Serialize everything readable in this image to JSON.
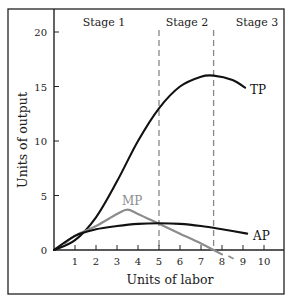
{
  "chart_data": {
    "type": "line",
    "title": "",
    "xlabel": "Units of labor",
    "ylabel": "Units of output",
    "xlim": [
      0,
      11
    ],
    "ylim": [
      0,
      21
    ],
    "x_ticks": [
      1,
      2,
      3,
      4,
      5,
      6,
      7,
      8,
      9,
      10
    ],
    "y_ticks": [
      0,
      5,
      10,
      15,
      20
    ],
    "origin_label": "0",
    "grid": false,
    "legend": "none (curves labeled inline)",
    "stages": [
      {
        "label": "Stage 1",
        "from": 0,
        "to": 5
      },
      {
        "label": "Stage 2",
        "from": 5,
        "to": 7.6
      },
      {
        "label": "Stage 3",
        "from": 7.6,
        "to": 11
      }
    ],
    "dividers": [
      {
        "x": 5,
        "style": "dashed",
        "color": "#888888",
        "meaning": "MP = AP (AP max)"
      },
      {
        "x": 7.6,
        "style": "dashed",
        "color": "#888888",
        "meaning": "MP = 0 (TP max)"
      }
    ],
    "series": [
      {
        "name": "TP",
        "color": "#111111",
        "x": [
          0,
          1,
          2,
          3,
          4,
          5,
          6,
          7,
          7.6,
          8.5,
          9.1
        ],
        "y": [
          0,
          0.9,
          3.0,
          6.3,
          10.0,
          13.0,
          15.0,
          15.9,
          16.0,
          15.6,
          14.9
        ]
      },
      {
        "name": "MP",
        "color": "#8c8c8c",
        "x": [
          0.5,
          1,
          2,
          3,
          3.5,
          4,
          5,
          6,
          7,
          7.6,
          8.0
        ],
        "y": [
          0.6,
          1.3,
          2.2,
          3.3,
          3.7,
          3.3,
          2.4,
          1.5,
          0.6,
          0.0,
          -0.4
        ]
      },
      {
        "name": "AP",
        "color": "#111111",
        "x": [
          0,
          1,
          2,
          3,
          4,
          5,
          6,
          7,
          8,
          9.2
        ],
        "y": [
          0,
          1.3,
          1.9,
          2.2,
          2.4,
          2.45,
          2.4,
          2.2,
          1.9,
          1.5
        ]
      }
    ]
  }
}
